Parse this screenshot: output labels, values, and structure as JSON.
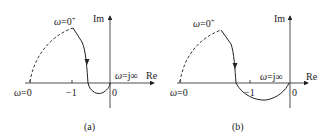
{
  "panels": [
    {
      "id": "a",
      "caption": "(a)",
      "axes": {
        "re_label": "Re",
        "im_label": "Im"
      },
      "labels": {
        "omega_zero_plus": "ω=0⁺",
        "omega_zero": "ω=0",
        "omega_jinf": "ω=j∞",
        "minus_one": "−1",
        "origin": "0"
      }
    },
    {
      "id": "b",
      "caption": "(b)",
      "axes": {
        "re_label": "Re",
        "im_label": "Im"
      },
      "labels": {
        "omega_zero_plus": "ω=0⁺",
        "omega_zero": "ω=0",
        "omega_jinf": "ω=j∞",
        "minus_one": "−1",
        "origin": "0"
      }
    }
  ],
  "colors": {
    "stroke": "#222222",
    "background": "#ffffff"
  }
}
